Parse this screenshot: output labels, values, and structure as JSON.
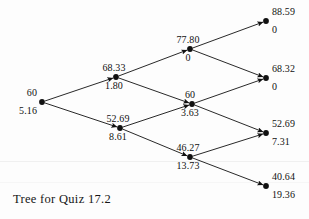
{
  "figure": {
    "caption": "Tree for Quiz 17.2",
    "background_color": "#fdfdfd",
    "ink_color": "#111111"
  },
  "chart_data": {
    "type": "diagram",
    "diagram_type": "binomial-tree",
    "title": "Tree for Quiz 17.2",
    "value_labels": {
      "upper": "asset price",
      "lower": "option value"
    },
    "nodes": [
      {
        "id": "n0",
        "step": 0,
        "up_moves": 0,
        "upper": "60",
        "lower": "5.16",
        "x": 42,
        "y": 102,
        "label_side": "left"
      },
      {
        "id": "n1u",
        "step": 1,
        "up_moves": 1,
        "upper": "68.33",
        "lower": "1.80",
        "x": 116,
        "y": 77,
        "label_side": "center"
      },
      {
        "id": "n1d",
        "step": 1,
        "up_moves": 0,
        "upper": "52.69",
        "lower": "8.61",
        "x": 120,
        "y": 128,
        "label_side": "center"
      },
      {
        "id": "n2uu",
        "step": 2,
        "up_moves": 2,
        "upper": "77.80",
        "lower": "0",
        "x": 190,
        "y": 49,
        "label_side": "center"
      },
      {
        "id": "n2ud",
        "step": 2,
        "up_moves": 1,
        "upper": "60",
        "lower": "3.63",
        "x": 192,
        "y": 104,
        "label_side": "center"
      },
      {
        "id": "n2dd",
        "step": 2,
        "up_moves": 0,
        "upper": "46.27",
        "lower": "13.73",
        "x": 190,
        "y": 157,
        "label_side": "center"
      },
      {
        "id": "n3uuu",
        "step": 3,
        "up_moves": 3,
        "upper": "88.59",
        "lower": "0",
        "x": 266,
        "y": 21,
        "label_side": "right"
      },
      {
        "id": "n3uud",
        "step": 3,
        "up_moves": 2,
        "upper": "68.32",
        "lower": "0",
        "x": 266,
        "y": 78,
        "label_side": "right"
      },
      {
        "id": "n3udd",
        "step": 3,
        "up_moves": 1,
        "upper": "52.69",
        "lower": "7.31",
        "x": 266,
        "y": 133,
        "label_side": "right"
      },
      {
        "id": "n3ddd",
        "step": 3,
        "up_moves": 0,
        "upper": "40.64",
        "lower": "19.36",
        "x": 266,
        "y": 186,
        "label_side": "right"
      }
    ],
    "edges": [
      {
        "from": "n0",
        "to": "n1u",
        "direction": "up"
      },
      {
        "from": "n0",
        "to": "n1d",
        "direction": "down"
      },
      {
        "from": "n1u",
        "to": "n2uu",
        "direction": "up"
      },
      {
        "from": "n1u",
        "to": "n2ud",
        "direction": "down"
      },
      {
        "from": "n1d",
        "to": "n2ud",
        "direction": "up"
      },
      {
        "from": "n1d",
        "to": "n2dd",
        "direction": "down"
      },
      {
        "from": "n2uu",
        "to": "n3uuu",
        "direction": "up"
      },
      {
        "from": "n2uu",
        "to": "n3uud",
        "direction": "down"
      },
      {
        "from": "n2ud",
        "to": "n3uud",
        "direction": "up"
      },
      {
        "from": "n2ud",
        "to": "n3udd",
        "direction": "down"
      },
      {
        "from": "n2dd",
        "to": "n3udd",
        "direction": "up"
      },
      {
        "from": "n2dd",
        "to": "n3ddd",
        "direction": "down"
      }
    ]
  }
}
